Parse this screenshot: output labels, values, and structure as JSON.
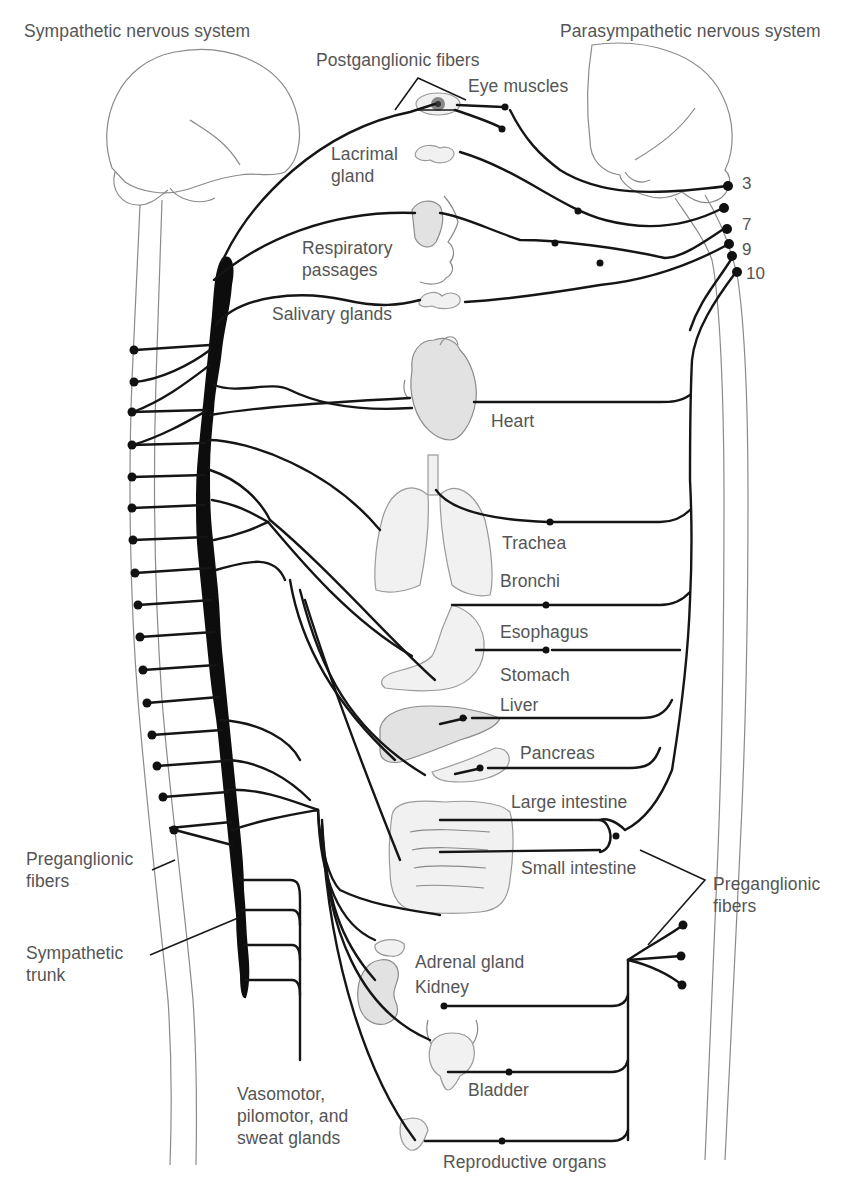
{
  "title_left": "Sympathetic nervous system",
  "title_right": "Parasympathetic nervous system",
  "labels": {
    "postganglionic": "Postganglionic fibers",
    "eye": "Eye muscles",
    "lacrimal": "Lacrimal\ngland",
    "respiratory": "Respiratory\npassages",
    "salivary": "Salivary glands",
    "heart": "Heart",
    "trachea": "Trachea",
    "bronchi": "Bronchi",
    "esophagus": "Esophagus",
    "stomach": "Stomach",
    "liver": "Liver",
    "pancreas": "Pancreas",
    "large_intestine": "Large intestine",
    "small_intestine": "Small intestine",
    "preganglionic_left": "Preganglionic\nfibers",
    "preganglionic_right": "Preganglionic\nfibers",
    "sympathetic_trunk": "Sympathetic\ntrunk",
    "adrenal": "Adrenal gland",
    "kidney": "Kidney",
    "bladder": "Bladder",
    "vasomotor": "Vasomotor,\npilomotor, and\nsweat glands",
    "reproductive": "Reproductive organs"
  },
  "cranial_nerves": [
    "3",
    "7",
    "9",
    "10"
  ],
  "colors": {
    "nerve": "#151515",
    "outline": "#8a8a8a",
    "text": "#555555",
    "background": "#ffffff"
  }
}
